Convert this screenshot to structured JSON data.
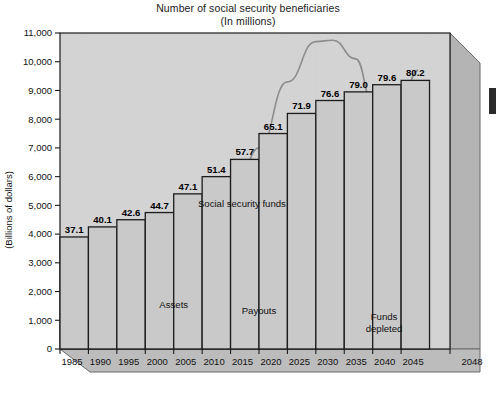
{
  "chart_data": {
    "type": "bar",
    "title": "Number of social security beneficiaries",
    "subtitle": "(In millions)",
    "ylabel": "(Billions of dollars)",
    "xlabel": "",
    "grid": false,
    "legend_position": "inline-annotations",
    "categories": [
      "1985",
      "1990",
      "1995",
      "2000",
      "2005",
      "2010",
      "2015",
      "2020",
      "2025",
      "2030",
      "2035",
      "2040",
      "2045"
    ],
    "xtick_labels": [
      "1985",
      "1990",
      "1995",
      "2000",
      "2005",
      "2010",
      "2015",
      "2020",
      "2025",
      "2030",
      "2035",
      "2040",
      "2045",
      "2048"
    ],
    "ytick_labels": [
      "0",
      "1,000",
      "2,000",
      "3,000",
      "4,000",
      "5,000",
      "6,000",
      "7,000",
      "8,000",
      "9,000",
      "10,000",
      "11,000"
    ],
    "ytick_values": [
      0,
      1000,
      2000,
      3000,
      4000,
      5000,
      6000,
      7000,
      8000,
      9000,
      10000,
      11000
    ],
    "ylim": [
      0,
      11000
    ],
    "bar_value_labels": [
      "37.1",
      "40.1",
      "42.6",
      "44.7",
      "47.1",
      "51.4",
      "57.7",
      "65.1",
      "71.9",
      "76.6",
      "79.0",
      "79.6",
      "80.2"
    ],
    "values": [
      37.1,
      40.1,
      42.6,
      44.7,
      47.1,
      51.4,
      57.7,
      65.1,
      71.9,
      76.6,
      79.0,
      79.6,
      80.2
    ],
    "bar_axis_equivalent": [
      3900,
      4250,
      4500,
      4750,
      5400,
      6000,
      6600,
      7500,
      8200,
      8650,
      8950,
      9200,
      9350
    ],
    "series": [
      {
        "name": "Assets",
        "type": "line",
        "x": [
          1985,
          1990,
          1995,
          2000,
          2005,
          2010,
          2015,
          2020,
          2025,
          2030,
          2033,
          2037,
          2040,
          2045,
          2048
        ],
        "values": [
          60,
          180,
          420,
          900,
          1750,
          3000,
          4700,
          7000,
          9300,
          10700,
          10750,
          10100,
          8600,
          3200,
          150
        ]
      },
      {
        "name": "Payouts",
        "type": "line",
        "x": [
          1985,
          1990,
          1995,
          2000,
          2005,
          2010,
          2015,
          2020,
          2025,
          2030,
          2035,
          2040,
          2045,
          2048
        ],
        "values": [
          190,
          260,
          360,
          500,
          700,
          1000,
          1450,
          2100,
          2950,
          3950,
          5300,
          6900,
          8650,
          9700
        ]
      }
    ],
    "annotations": [
      {
        "text": "Social security funds",
        "x": 2017,
        "y": 4950
      },
      {
        "text": "Assets",
        "x": 2005,
        "y": 1420
      },
      {
        "text": "Payouts",
        "x": 2020,
        "y": 1220
      },
      {
        "text": "Funds depleted",
        "x": 2042,
        "y": 1000
      }
    ],
    "colors": {
      "bar_fill": "#c9c9c9",
      "bar_stroke": "#1c1c1c",
      "plot_background": "#d3d3d3",
      "curve": "#8d8d8d",
      "page_background": "#ffffff",
      "side_panel": "#b4b4b4",
      "floor_panel": "#bcbcbc",
      "text": "#111111"
    }
  }
}
